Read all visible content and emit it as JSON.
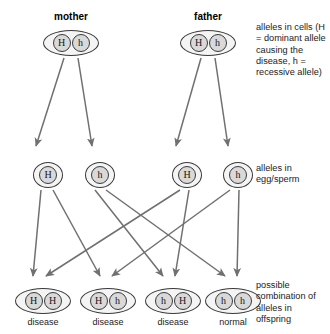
{
  "diagram": {
    "title_mother": "mother",
    "title_father": "father",
    "parents": [
      {
        "name": "mother",
        "x": 43,
        "y": 30,
        "alleles": [
          "H",
          "h"
        ]
      },
      {
        "name": "father",
        "x": 180,
        "y": 30,
        "alleles": [
          "H",
          "h"
        ]
      }
    ],
    "gametes": [
      {
        "id": "mother-gamete-1",
        "x": 33,
        "y": 162,
        "allele": "H",
        "parent": "mother"
      },
      {
        "id": "mother-gamete-2",
        "x": 85,
        "y": 162,
        "allele": "h",
        "parent": "mother"
      },
      {
        "id": "father-gamete-1",
        "x": 172,
        "y": 162,
        "allele": "H",
        "parent": "father"
      },
      {
        "id": "father-gamete-2",
        "x": 223,
        "y": 162,
        "allele": "h",
        "parent": "father"
      }
    ],
    "offspring": [
      {
        "id": "offspring-1",
        "x": 15,
        "y": 288,
        "alleles": [
          "H",
          "H"
        ],
        "outcome": "disease"
      },
      {
        "id": "offspring-2",
        "x": 80,
        "y": 288,
        "alleles": [
          "H",
          "h"
        ],
        "outcome": "disease"
      },
      {
        "id": "offspring-3",
        "x": 145,
        "y": 288,
        "alleles": [
          "h",
          "H"
        ],
        "outcome": "disease"
      },
      {
        "id": "offspring-4",
        "x": 205,
        "y": 288,
        "alleles": [
          "h",
          "h"
        ],
        "outcome": "normal"
      }
    ],
    "annotations": {
      "cells": "alleles in cells (H = dominant allele causing the disease, h = recessive allele)",
      "gametes": "alleles in egg/sperm",
      "offspring": "possible combination of alleles in offspring"
    },
    "colors": {
      "stroke": "#6f7072",
      "outline": "#3a3a3a",
      "allele_fill": "#d9d9d9",
      "cell_fill": "#f4f4f4",
      "text": "#1a1a1a",
      "background": "#ffffff"
    }
  }
}
